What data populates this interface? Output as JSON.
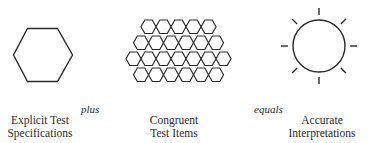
{
  "diagram": {
    "type": "equation-of-concepts",
    "stroke_color": "#2a2a2a",
    "background": "#ffffff",
    "terms": [
      {
        "id": "specifications",
        "icon": "single-hexagon",
        "label_lines": [
          "Explicit Test",
          "Specifications"
        ]
      },
      {
        "id": "test-items",
        "icon": "hexagon-cluster",
        "hexagon_rows": [
          5,
          6,
          7,
          6
        ],
        "label_lines": [
          "Congruent",
          "Test Items"
        ]
      },
      {
        "id": "interpretations",
        "icon": "sun-circle-with-rays",
        "ray_count": 8,
        "label_lines": [
          "Accurate",
          "Interpretations"
        ]
      }
    ],
    "connectors": [
      {
        "id": "plus",
        "text": "plus"
      },
      {
        "id": "equals",
        "text": "equals"
      }
    ]
  }
}
